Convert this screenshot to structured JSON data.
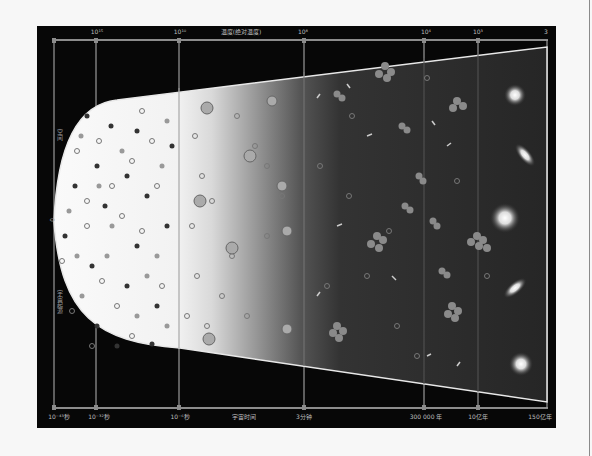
{
  "diagram": {
    "title_axis_top": "温度(绝对温度)",
    "title_axis_bottom": "宇宙时间",
    "top_ticks": [
      {
        "label": "10¹⁵",
        "x": 60
      },
      {
        "label": "10¹⁰",
        "x": 143
      },
      {
        "label": "10⁸",
        "x": 266
      },
      {
        "label": "10⁴",
        "x": 389
      },
      {
        "label": "10³",
        "x": 441
      },
      {
        "label": "3",
        "x": 509
      }
    ],
    "bottom_ticks": [
      {
        "label": "10⁻⁴³秒",
        "x": 20
      },
      {
        "label": "10⁻³²秒",
        "x": 62
      },
      {
        "label": "10⁻⁶秒",
        "x": 143
      },
      {
        "label": "3分钟",
        "x": 267
      },
      {
        "label": "300 000 年",
        "x": 389
      },
      {
        "label": "10亿年",
        "x": 441
      },
      {
        "label": "150亿年",
        "x": 503
      }
    ],
    "left_axis": {
      "upper_label": "空间",
      "center_label": "0",
      "lower_label": "宇宙起源"
    },
    "stages": [
      "quark-soup",
      "hadrons-and-leptons",
      "nucleosynthesis",
      "atoms-and-clusters",
      "galaxies"
    ],
    "colors": {
      "background": "#070707",
      "axis": "#8c8c8c",
      "cone_light": "#f4f4f4",
      "cone_dark": "#2a2a2a"
    }
  }
}
